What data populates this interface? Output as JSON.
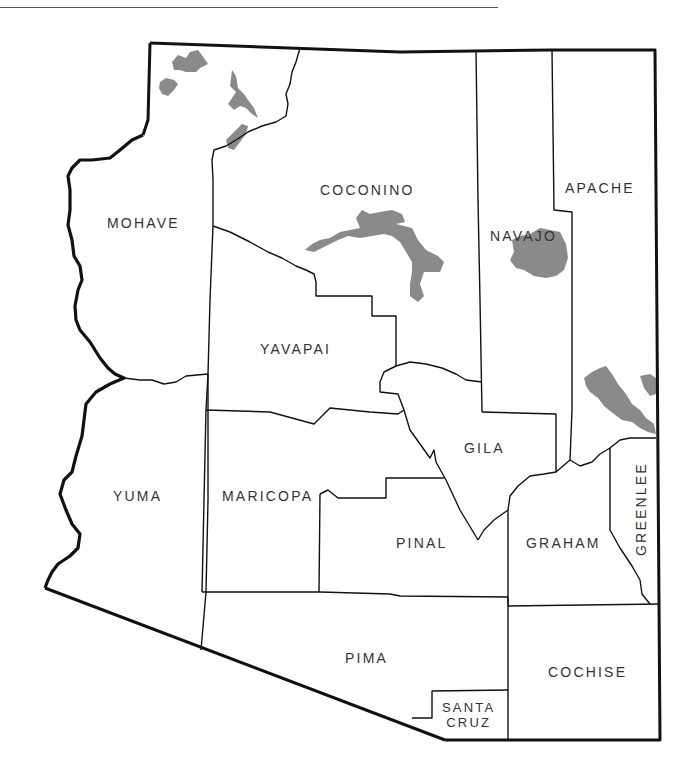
{
  "map": {
    "title": "",
    "state": "Arizona",
    "shaded_areas_color": "#8a8a8a",
    "counties": [
      {
        "id": "mohave",
        "label": "MOHAVE"
      },
      {
        "id": "coconino",
        "label": "COCONINO"
      },
      {
        "id": "navajo",
        "label": "NAVAJO"
      },
      {
        "id": "apache",
        "label": "APACHE"
      },
      {
        "id": "yavapai",
        "label": "YAVAPAI"
      },
      {
        "id": "gila",
        "label": "GILA"
      },
      {
        "id": "yuma",
        "label": "YUMA"
      },
      {
        "id": "maricopa",
        "label": "MARICOPA"
      },
      {
        "id": "pinal",
        "label": "PINAL"
      },
      {
        "id": "graham",
        "label": "GRAHAM"
      },
      {
        "id": "greenlee",
        "label": "GREENLEE"
      },
      {
        "id": "pima",
        "label": "PIMA"
      },
      {
        "id": "santa-cruz",
        "label_line1": "SANTA",
        "label_line2": "CRUZ"
      },
      {
        "id": "cochise",
        "label": "COCHISE"
      }
    ]
  }
}
